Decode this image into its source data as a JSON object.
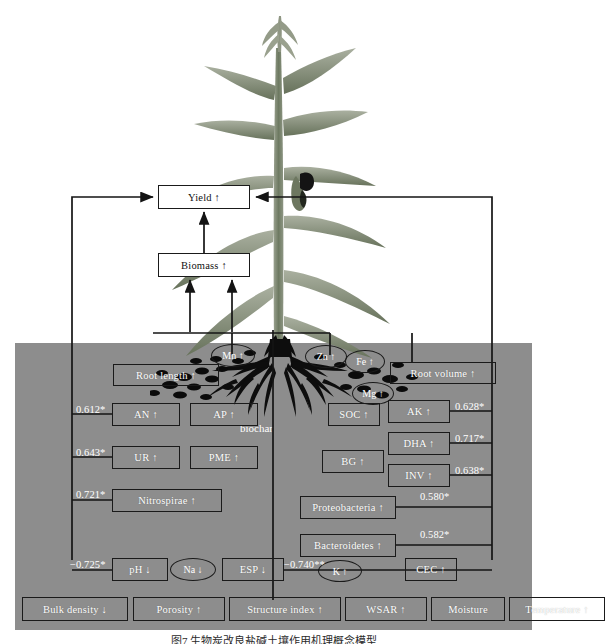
{
  "figure": {
    "caption": "图7 生物炭改良盐碱土壤作用机理概念模型",
    "biochar_label": "biochar"
  },
  "top_nodes": [
    {
      "id": "yield",
      "label": "Yield ↑",
      "x": 158,
      "y": 185,
      "w": 92,
      "h": 24
    },
    {
      "id": "biomass",
      "label": "Biomass ↑",
      "x": 158,
      "y": 253,
      "w": 92,
      "h": 24
    }
  ],
  "soil": {
    "x": 15,
    "y": 343,
    "w": 517,
    "h": 287,
    "color": "#8d8d8d"
  },
  "nutrient_ellipses": [
    {
      "id": "mn",
      "label": "Mn ↑",
      "x": 211,
      "y": 344,
      "w": 44,
      "h": 23
    },
    {
      "id": "zn",
      "label": "Zn ↑",
      "x": 305,
      "y": 345,
      "w": 42,
      "h": 23
    },
    {
      "id": "fe",
      "label": "Fe ↑",
      "x": 345,
      "y": 350,
      "w": 40,
      "h": 23
    },
    {
      "id": "mg",
      "label": "Mg ↑",
      "x": 352,
      "y": 382,
      "w": 42,
      "h": 23
    },
    {
      "id": "k",
      "label": "K ↑",
      "x": 318,
      "y": 560,
      "w": 44,
      "h": 22
    },
    {
      "id": "na",
      "label": "Na ↓",
      "x": 170,
      "y": 558,
      "w": 46,
      "h": 23
    }
  ],
  "soil_nodes": [
    {
      "id": "root-length",
      "label": "Root length ↑",
      "x": 113,
      "y": 364,
      "w": 106,
      "h": 22
    },
    {
      "id": "root-volume",
      "label": "Root volume ↑",
      "x": 390,
      "y": 362,
      "w": 106,
      "h": 22
    },
    {
      "id": "an",
      "label": "AN ↑",
      "x": 112,
      "y": 403,
      "w": 68,
      "h": 23
    },
    {
      "id": "ap",
      "label": "AP ↑",
      "x": 190,
      "y": 403,
      "w": 68,
      "h": 23
    },
    {
      "id": "soc",
      "label": "SOC ↑",
      "x": 328,
      "y": 403,
      "w": 52,
      "h": 23
    },
    {
      "id": "ak",
      "label": "AK ↑",
      "x": 388,
      "y": 400,
      "w": 62,
      "h": 23
    },
    {
      "id": "ur",
      "label": "UR ↑",
      "x": 112,
      "y": 446,
      "w": 68,
      "h": 23
    },
    {
      "id": "pme",
      "label": "PME ↑",
      "x": 190,
      "y": 446,
      "w": 68,
      "h": 23
    },
    {
      "id": "dha",
      "label": "DHA ↑",
      "x": 388,
      "y": 432,
      "w": 62,
      "h": 23
    },
    {
      "id": "bg",
      "label": "BG ↑",
      "x": 322,
      "y": 450,
      "w": 62,
      "h": 23
    },
    {
      "id": "inv",
      "label": "INV ↑",
      "x": 388,
      "y": 464,
      "w": 62,
      "h": 23
    },
    {
      "id": "nitrospirae",
      "label": "Nitrospirae ↑",
      "x": 112,
      "y": 489,
      "w": 110,
      "h": 23
    },
    {
      "id": "proteobacteria",
      "label": "Proteobacteria ↑",
      "x": 300,
      "y": 496,
      "w": 96,
      "h": 23
    },
    {
      "id": "bacteroidetes",
      "label": "Bacteroidetes ↑",
      "x": 300,
      "y": 534,
      "w": 96,
      "h": 23
    },
    {
      "id": "ph",
      "label": "pH ↓",
      "x": 112,
      "y": 558,
      "w": 56,
      "h": 23
    },
    {
      "id": "esp",
      "label": "ESP ↓",
      "x": 222,
      "y": 558,
      "w": 62,
      "h": 23
    },
    {
      "id": "cec",
      "label": "CEC ↑",
      "x": 405,
      "y": 558,
      "w": 52,
      "h": 23
    }
  ],
  "bottom_nodes": [
    {
      "id": "bulk-density",
      "label": "Bulk density ↓",
      "x": 22,
      "y": 597,
      "w": 106,
      "h": 24
    },
    {
      "id": "porosity",
      "label": "Porosity ↑",
      "x": 133,
      "y": 597,
      "w": 92,
      "h": 24
    },
    {
      "id": "structure-index",
      "label": "Structure index ↑",
      "x": 229,
      "y": 597,
      "w": 112,
      "h": 24
    },
    {
      "id": "wsar",
      "label": "WSAR ↑",
      "x": 345,
      "y": 597,
      "w": 82,
      "h": 24
    },
    {
      "id": "moisture",
      "label": "Moisture",
      "x": 431,
      "y": 597,
      "w": 74,
      "h": 24
    },
    {
      "id": "temperature",
      "label": "Temperature ↑",
      "x": 433,
      "y": 597,
      "w": 96,
      "h": 24
    }
  ],
  "coefficients": [
    {
      "id": "coef-an",
      "value": "0.612*",
      "x": 76,
      "y": 404
    },
    {
      "id": "coef-ur",
      "value": "0.643*",
      "x": 76,
      "y": 447
    },
    {
      "id": "coef-nitrospirae",
      "value": "0.721*",
      "x": 76,
      "y": 489
    },
    {
      "id": "coef-ph",
      "value": "−0.725*",
      "x": 70,
      "y": 559
    },
    {
      "id": "coef-esp",
      "value": "−0.740**",
      "x": 284,
      "y": 559
    },
    {
      "id": "coef-ak",
      "value": "0.628*",
      "x": 455,
      "y": 401
    },
    {
      "id": "coef-dha",
      "value": "0.717*",
      "x": 455,
      "y": 433
    },
    {
      "id": "coef-inv",
      "value": "0.638*",
      "x": 455,
      "y": 465
    },
    {
      "id": "coef-proteobacteria",
      "value": "0.580*",
      "x": 420,
      "y": 491
    },
    {
      "id": "coef-bacteroidetes",
      "value": "0.582*",
      "x": 420,
      "y": 529
    }
  ],
  "colors": {
    "soil": "#8d8d8d",
    "line": "#141414",
    "node_text": "#ffffff",
    "top_node_text": "#111111",
    "plant_green": "#6f7a63"
  }
}
